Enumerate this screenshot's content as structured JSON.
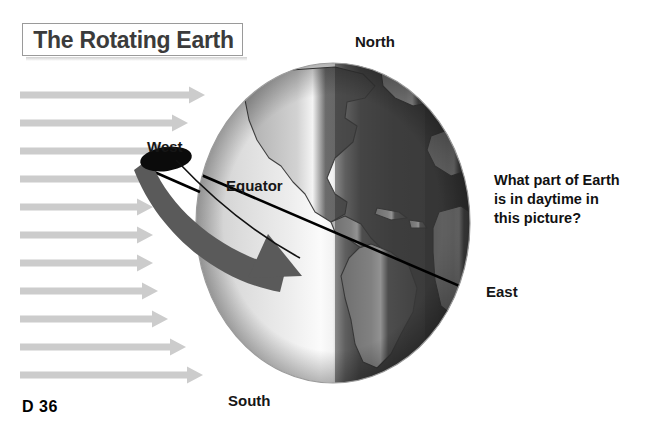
{
  "page": {
    "title": "The Rotating Earth",
    "page_number": "D 36",
    "background_color": "#ffffff"
  },
  "diagram": {
    "globe": {
      "day_side_label": "day",
      "night_side_label": "night",
      "day_color": "#e6e6e6",
      "night_color": "#4a4a4a",
      "terminator_color": "#f8f8f8",
      "outline_color": "#8a8a8a",
      "continents_day_color": "#b8b8b8",
      "continents_night_color": "#5e5e5e",
      "landmasses": [
        "North America",
        "South America",
        "Greenland",
        "Africa",
        "Europe"
      ]
    },
    "equator": {
      "label": "Equator",
      "line_color": "#000000"
    },
    "compass_labels": {
      "north": "North",
      "south": "South",
      "east": "East",
      "west": "West"
    },
    "rotation_arrow": {
      "name": "rotation-direction-arrow",
      "color": "#5a5a5a",
      "tail_color": "#0a0a0a",
      "direction": "west-to-east"
    },
    "sunlight": {
      "name": "sunlight-rays",
      "color": "#cccccc",
      "direction": "left-to-right",
      "ray_count": 11,
      "rays": [
        {
          "y": 95,
          "length": 185
        },
        {
          "y": 123,
          "length": 168
        },
        {
          "y": 151,
          "length": 150
        },
        {
          "y": 179,
          "length": 140
        },
        {
          "y": 207,
          "length": 133
        },
        {
          "y": 235,
          "length": 133
        },
        {
          "y": 263,
          "length": 133
        },
        {
          "y": 291,
          "length": 138
        },
        {
          "y": 319,
          "length": 148
        },
        {
          "y": 347,
          "length": 166
        },
        {
          "y": 375,
          "length": 183
        }
      ]
    }
  },
  "question": {
    "line1": "What part of Earth",
    "line2": "is in daytime in",
    "line3": "this picture?"
  }
}
